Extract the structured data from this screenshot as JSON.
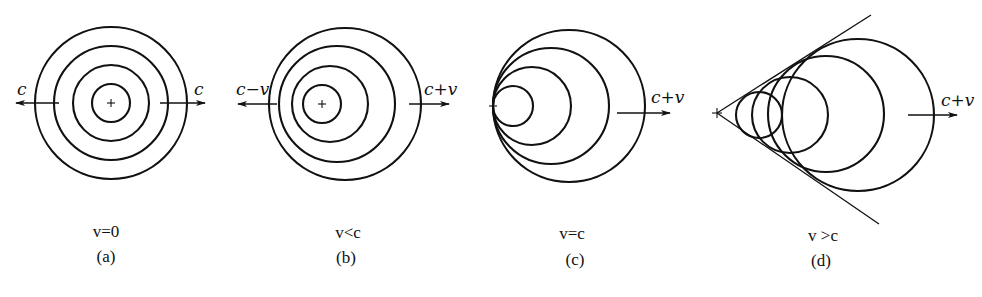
{
  "figure": {
    "stroke_color": "#111111",
    "background": "#ffffff",
    "panels": [
      {
        "id": "a",
        "caption": "(a)",
        "condition": "v=0",
        "left_label": "c",
        "right_label": "c",
        "source": {
          "x": 111,
          "y": 103
        },
        "circles": [
          {
            "cx": 111,
            "cy": 103,
            "r": 19
          },
          {
            "cx": 111,
            "cy": 103,
            "r": 38
          },
          {
            "cx": 111,
            "cy": 103,
            "r": 57
          },
          {
            "cx": 111,
            "cy": 103,
            "r": 76
          }
        ]
      },
      {
        "id": "b",
        "caption": "(b)",
        "condition": "v<c",
        "left_label": "c−v",
        "right_label": "c+v",
        "source": {
          "x": 322,
          "y": 104
        },
        "circles": [
          {
            "cx": 322,
            "cy": 104,
            "r": 19
          },
          {
            "cx": 330,
            "cy": 104,
            "r": 38
          },
          {
            "cx": 337,
            "cy": 104,
            "r": 58
          },
          {
            "cx": 345,
            "cy": 104,
            "r": 76
          }
        ]
      },
      {
        "id": "c",
        "caption": "(c)",
        "condition": "v=c",
        "right_label": "c+v",
        "source": {
          "x": 493,
          "y": 106
        },
        "circles": [
          {
            "cx": 513,
            "cy": 106,
            "r": 20
          },
          {
            "cx": 532,
            "cy": 106,
            "r": 39
          },
          {
            "cx": 551,
            "cy": 106,
            "r": 58
          },
          {
            "cx": 569,
            "cy": 106,
            "r": 76
          }
        ]
      },
      {
        "id": "d",
        "caption": "(d)",
        "condition": "v >c",
        "right_label": "c+v",
        "source": {
          "x": 717,
          "y": 113
        },
        "circles": [
          {
            "cx": 759,
            "cy": 115,
            "r": 23
          },
          {
            "cx": 790,
            "cy": 115,
            "r": 38
          },
          {
            "cx": 826,
            "cy": 114,
            "r": 58
          },
          {
            "cx": 858,
            "cy": 115,
            "r": 76
          }
        ],
        "mach_cone": {
          "apex": {
            "x": 717,
            "y": 113
          },
          "upper_end": {
            "x": 871,
            "y": 15
          },
          "lower_end": {
            "x": 879,
            "y": 224
          }
        }
      }
    ]
  }
}
